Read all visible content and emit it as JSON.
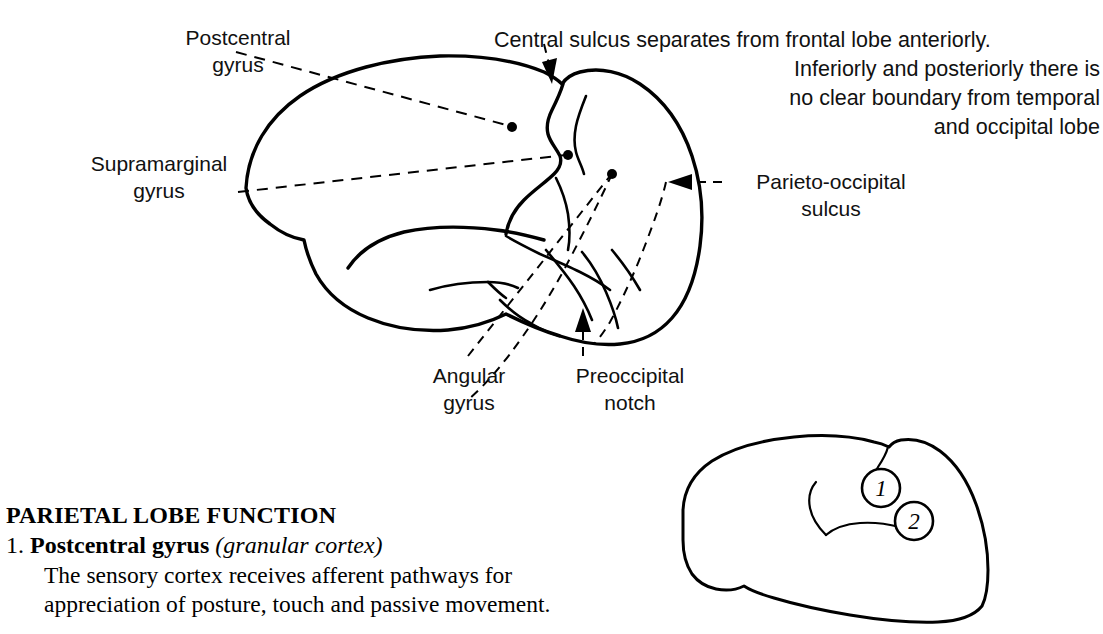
{
  "figure": {
    "background_color": "#ffffff",
    "ink_color": "#000000",
    "title_hidden": "Lateral view of cerebral hemisphere showing parietal lobe landmarks"
  },
  "labels": {
    "postcentral_gyrus": "Postcentral\ngyrus",
    "supramarginal_gyrus": "Supramarginal\ngyrus",
    "angular_gyrus": "Angular\ngyrus",
    "preoccipital_notch": "Preoccipital\nnotch",
    "parieto_occipital_sulcus": "Parieto-occipital\nsulcus"
  },
  "note_central_sulcus": {
    "line1": "Central sulcus separates from frontal lobe anteriorly.",
    "line2": "Inferiorly and posteriorly there is",
    "line3": "no clear boundary from temporal",
    "line4": "and occipital lobe"
  },
  "function_section": {
    "heading": "PARIETAL LOBE FUNCTION",
    "item_number": "1.",
    "item_term": "Postcentral gyrus",
    "item_paren": "(granular cortex)",
    "body_line1": "The sensory cortex receives afferent pathways for",
    "body_line2": "appreciation of posture, touch and passive movement."
  },
  "inset_brain": {
    "marker_1": "1",
    "marker_2": "2"
  }
}
